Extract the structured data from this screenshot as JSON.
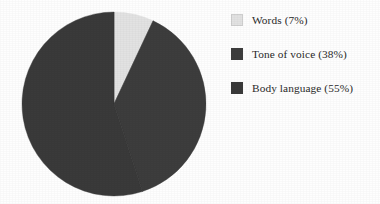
{
  "chart_data": {
    "type": "pie",
    "title": "",
    "categories": [
      "Words",
      "Tone of voice",
      "Body language"
    ],
    "values": [
      7,
      38,
      55
    ],
    "value_unit": "%",
    "labels": [
      "Words (7%)",
      "Tone of voice (38%)",
      "Body language (55%)"
    ],
    "colors": [
      "#e2e2e2",
      "#3d3d3d",
      "#3a3a3a"
    ],
    "start_angle_deg": 0,
    "direction": "clockwise",
    "legend_position": "right",
    "grid": false,
    "background": "#fefefe"
  },
  "legend": {
    "items": [
      {
        "label": "Words (7%)",
        "name": "Words",
        "value": "7%",
        "color": "#e2e2e2"
      },
      {
        "label": "Tone of voice (38%)",
        "name": "Tone of voice",
        "value": "38%",
        "color": "#3d3d3d"
      },
      {
        "label": "Body language (55%)",
        "name": "Body language",
        "value": "55%",
        "color": "#3a3a3a"
      }
    ]
  },
  "pie": {
    "center_x": 114,
    "center_y": 104,
    "radius": 92
  }
}
